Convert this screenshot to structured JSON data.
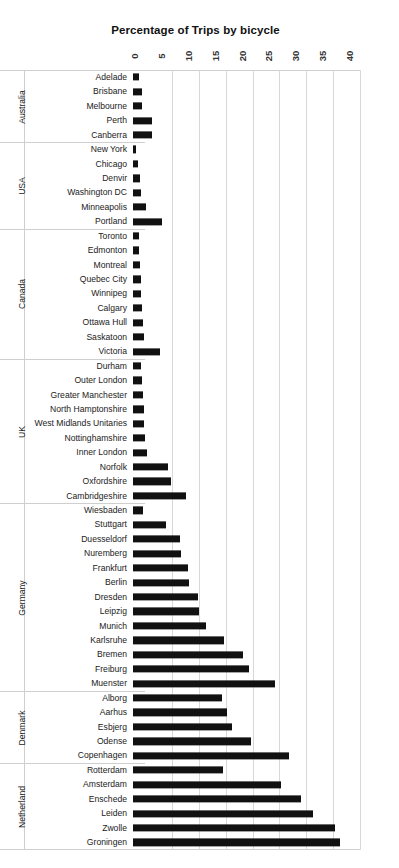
{
  "chart": {
    "title": "Percentage of Trips by bicycle",
    "xlabel": "",
    "ylabel": "",
    "axis_ticks": [
      "0",
      "5",
      "10",
      "15",
      "20",
      "25",
      "30",
      "35",
      "40"
    ],
    "bar_color": "#111111",
    "grid_color": "#d8d8d8",
    "groups": [
      "Australia",
      "USA",
      "Canada",
      "UK",
      "Germany",
      "Denmark",
      "Netherland"
    ]
  },
  "chart_data": {
    "type": "bar",
    "orientation": "horizontal",
    "title": "Percentage of Trips by bicycle",
    "xlabel": "",
    "ylabel": "",
    "xlim": [
      0,
      40
    ],
    "xticks": [
      0,
      5,
      10,
      15,
      20,
      25,
      30,
      35,
      40
    ],
    "grid": true,
    "legend": "none",
    "group_field": "country",
    "categories": [
      "Adelade",
      "Brisbane",
      "Melbourne",
      "Perth",
      "Canberra",
      "New York",
      "Chicago",
      "Denvir",
      "Washington DC",
      "Minneapolis",
      "Portland",
      "Toronto",
      "Edmonton",
      "Montreal",
      "Quebec City",
      "Winnipeg",
      "Calgary",
      "Ottawa Hull",
      "Saskatoon",
      "Victoria",
      "Durham",
      "Outer London",
      "Greater Manchester",
      "North Hamptonshire",
      "West Midlands Unitaries",
      "Nottinghamshire",
      "Inner London",
      "Norfolk",
      "Oxfordshire",
      "Cambridgeshire",
      "Wiesbaden",
      "Stuttgart",
      "Duesseldorf",
      "Nuremberg",
      "Frankfurt",
      "Berlin",
      "Dresden",
      "Leipzig",
      "Munich",
      "Karlsruhe",
      "Bremen",
      "Freiburg",
      "Muenster",
      "Alborg",
      "Aarhus",
      "Esbjerg",
      "Odense",
      "Copenhagen",
      "Rotterdam",
      "Amsterdam",
      "Enschede",
      "Leiden",
      "Zwolle",
      "Groningen"
    ],
    "values": [
      1.1,
      1.6,
      1.6,
      3.5,
      3.5,
      0.6,
      1.0,
      1.3,
      1.4,
      2.4,
      5.4,
      1.2,
      1.2,
      1.3,
      1.4,
      1.5,
      1.6,
      1.8,
      2.0,
      5.0,
      1.5,
      1.6,
      1.8,
      2.0,
      2.1,
      2.3,
      2.6,
      6.5,
      7.0,
      9.8,
      1.8,
      6.2,
      8.8,
      9.0,
      10.2,
      10.4,
      12.0,
      12.2,
      13.5,
      17.0,
      20.5,
      21.5,
      26.5,
      16.5,
      17.5,
      18.5,
      22.0,
      29.0,
      16.7,
      27.5,
      31.3,
      33.5,
      37.6,
      38.5
    ],
    "series_by_group": [
      {
        "group": "Australia",
        "items": [
          {
            "label": "Adelade",
            "value": 1.1
          },
          {
            "label": "Brisbane",
            "value": 1.6
          },
          {
            "label": "Melbourne",
            "value": 1.6
          },
          {
            "label": "Perth",
            "value": 3.5
          },
          {
            "label": "Canberra",
            "value": 3.5
          }
        ]
      },
      {
        "group": "USA",
        "items": [
          {
            "label": "New York",
            "value": 0.6
          },
          {
            "label": "Chicago",
            "value": 1.0
          },
          {
            "label": "Denvir",
            "value": 1.3
          },
          {
            "label": "Washington DC",
            "value": 1.4
          },
          {
            "label": "Minneapolis",
            "value": 2.4
          },
          {
            "label": "Portland",
            "value": 5.4
          }
        ]
      },
      {
        "group": "Canada",
        "items": [
          {
            "label": "Toronto",
            "value": 1.2
          },
          {
            "label": "Edmonton",
            "value": 1.2
          },
          {
            "label": "Montreal",
            "value": 1.3
          },
          {
            "label": "Quebec City",
            "value": 1.4
          },
          {
            "label": "Winnipeg",
            "value": 1.5
          },
          {
            "label": "Calgary",
            "value": 1.6
          },
          {
            "label": "Ottawa Hull",
            "value": 1.8
          },
          {
            "label": "Saskatoon",
            "value": 2.0
          },
          {
            "label": "Victoria",
            "value": 5.0
          }
        ]
      },
      {
        "group": "UK",
        "items": [
          {
            "label": "Durham",
            "value": 1.5
          },
          {
            "label": "Outer London",
            "value": 1.6
          },
          {
            "label": "Greater Manchester",
            "value": 1.8
          },
          {
            "label": "North Hamptonshire",
            "value": 2.0
          },
          {
            "label": "West Midlands Unitaries",
            "value": 2.1
          },
          {
            "label": "Nottinghamshire",
            "value": 2.3
          },
          {
            "label": "Inner London",
            "value": 2.6
          },
          {
            "label": "Norfolk",
            "value": 6.5
          },
          {
            "label": "Oxfordshire",
            "value": 7.0
          },
          {
            "label": "Cambridgeshire",
            "value": 9.8
          }
        ]
      },
      {
        "group": "Germany",
        "items": [
          {
            "label": "Wiesbaden",
            "value": 1.8
          },
          {
            "label": "Stuttgart",
            "value": 6.2
          },
          {
            "label": "Duesseldorf",
            "value": 8.8
          },
          {
            "label": "Nuremberg",
            "value": 9.0
          },
          {
            "label": "Frankfurt",
            "value": 10.2
          },
          {
            "label": "Berlin",
            "value": 10.4
          },
          {
            "label": "Dresden",
            "value": 12.0
          },
          {
            "label": "Leipzig",
            "value": 12.2
          },
          {
            "label": "Munich",
            "value": 13.5
          },
          {
            "label": "Karlsruhe",
            "value": 17.0
          },
          {
            "label": "Bremen",
            "value": 20.5
          },
          {
            "label": "Freiburg",
            "value": 21.5
          },
          {
            "label": "Muenster",
            "value": 26.5
          }
        ]
      },
      {
        "group": "Denmark",
        "items": [
          {
            "label": "Alborg",
            "value": 16.5
          },
          {
            "label": "Aarhus",
            "value": 17.5
          },
          {
            "label": "Esbjerg",
            "value": 18.5
          },
          {
            "label": "Odense",
            "value": 22.0
          },
          {
            "label": "Copenhagen",
            "value": 29.0
          }
        ]
      },
      {
        "group": "Netherland",
        "items": [
          {
            "label": "Rotterdam",
            "value": 16.7
          },
          {
            "label": "Amsterdam",
            "value": 27.5
          },
          {
            "label": "Enschede",
            "value": 31.3
          },
          {
            "label": "Leiden",
            "value": 33.5
          },
          {
            "label": "Zwolle",
            "value": 37.6
          },
          {
            "label": "Groningen",
            "value": 38.5
          }
        ]
      }
    ]
  }
}
